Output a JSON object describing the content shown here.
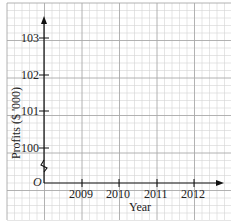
{
  "chart_data": {
    "type": "line",
    "title": "",
    "xlabel": "Year",
    "ylabel": "Profits ($ '000)",
    "x_ticks": [
      "2009",
      "2010",
      "2011",
      "2012"
    ],
    "y_ticks": [
      "100",
      "101",
      "102",
      "103"
    ],
    "origin_label": "O",
    "axis_break": "y-axis broken between 0 and 100",
    "series": [],
    "grid": true,
    "ylim": [
      99.3,
      103.5
    ],
    "xlim": [
      2008,
      2012.8
    ]
  },
  "labels": {
    "xlabel": "Year",
    "ylabel": "Profits ($ '000)",
    "origin": "O",
    "x0": "2009",
    "x1": "2010",
    "x2": "2011",
    "x3": "2012",
    "y0": "100",
    "y1": "101",
    "y2": "102",
    "y3": "103"
  }
}
